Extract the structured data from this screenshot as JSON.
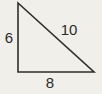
{
  "figure": {
    "type": "right-triangle",
    "sides": [
      {
        "name": "vertical-leg",
        "label": "6"
      },
      {
        "name": "hypotenuse",
        "label": "10"
      },
      {
        "name": "horizontal-leg",
        "label": "8"
      }
    ],
    "colors": {
      "background": "#f1efe9",
      "line": "#2e2e2e",
      "text": "#2b2b2b"
    }
  }
}
